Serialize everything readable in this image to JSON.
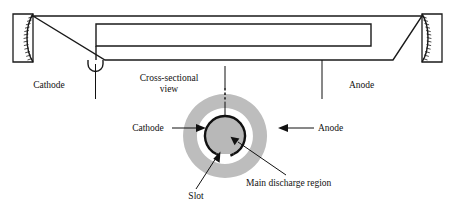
{
  "figure": {
    "width": 455,
    "height": 208,
    "background_color": "#ffffff"
  },
  "colors": {
    "line": "#1a1a1a",
    "text": "#111111",
    "annulus_gray": "#bdbdbd",
    "cathode_fill": "#b8b8b8",
    "background": "#ffffff"
  },
  "top_view": {
    "name": "longitudinal-section",
    "labels": {
      "cathode": "Cathode",
      "anode": "Anode",
      "cross_sectional_line1": "Cross-sectional",
      "cross_sectional_line2": "view"
    },
    "components": [
      {
        "name": "left-mirror",
        "type": "curved-hatched-mirror"
      },
      {
        "name": "right-mirror",
        "type": "curved-hatched-mirror"
      },
      {
        "name": "tube-envelope",
        "type": "tapered-outline"
      },
      {
        "name": "inner-bore",
        "type": "rectangle"
      },
      {
        "name": "cathode-notch",
        "type": "u-shaped-notch"
      }
    ]
  },
  "cross_section": {
    "name": "cross-sectional-view",
    "labels": {
      "cathode": "Cathode",
      "anode": "Anode",
      "slot": "Slot",
      "main_discharge_region": "Main discharge region"
    },
    "geometry": {
      "center_x": 225,
      "center_y": 136,
      "annulus_outer_radius": 42,
      "annulus_inner_radius": 28,
      "cathode_radius": 20,
      "slot_gap_description": "gap at bottom of cathode circle"
    }
  }
}
